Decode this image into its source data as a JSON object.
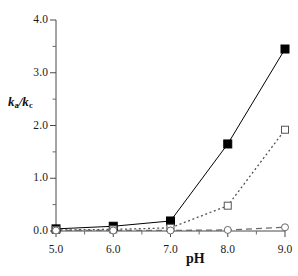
{
  "chart_data": {
    "type": "line",
    "title": "",
    "subtitle": "",
    "xlabel": "pH",
    "ylabel": "ka/kc",
    "ylabel_base": "k",
    "ylabel_sub1": "a",
    "ylabel_mid": "/k",
    "ylabel_sub2": "c",
    "x": [
      5.0,
      6.0,
      7.0,
      8.0,
      9.0
    ],
    "xlim": [
      5.0,
      9.0
    ],
    "ylim": [
      0.0,
      4.0
    ],
    "grid": false,
    "legend": "none",
    "x_tick_labels": [
      "5.0",
      "6.0",
      "7.0",
      "8.0",
      "9.0"
    ],
    "y_tick_labels": [
      "0.0",
      "1.0",
      "2.0",
      "3.0",
      "4.0"
    ],
    "y_major_ticks": [
      0.0,
      1.0,
      2.0,
      3.0,
      4.0
    ],
    "y_minor_ticks": [
      0.5,
      1.5,
      2.5,
      3.5
    ],
    "x_minor_ticks": [
      5.5,
      6.5,
      7.5,
      8.5
    ],
    "series": [
      {
        "name": "filled-square-series",
        "marker": "filled-square",
        "linestyle": "solid",
        "color": "#000000",
        "values": [
          0.04,
          0.09,
          0.19,
          1.65,
          3.45
        ]
      },
      {
        "name": "open-square-series",
        "marker": "open-square",
        "linestyle": "dotted",
        "color": "#555555",
        "values": [
          0.02,
          0.03,
          0.06,
          0.48,
          1.92
        ]
      },
      {
        "name": "open-circle-series",
        "marker": "open-circle",
        "linestyle": "dashed",
        "color": "#6a6a6a",
        "values": [
          0.01,
          0.01,
          0.01,
          0.02,
          0.07
        ]
      }
    ]
  }
}
